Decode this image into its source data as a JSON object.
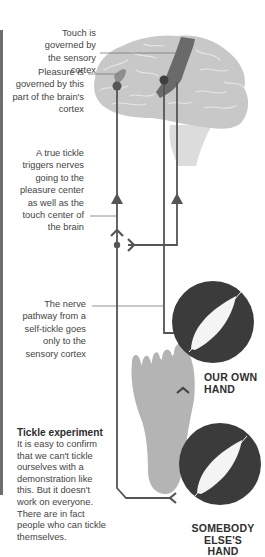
{
  "labels": {
    "touch": "Touch is governed by the sensory cortex",
    "pleasure": "Pleasure is governed by this part of the brain's cortex",
    "true_tickle": "A true tickle triggers nerves going to the pleasure center as well as the touch center of the brain",
    "nerve_pathway": "The nerve pathway from a self-tickle goes only to the sensory cortex"
  },
  "hands": {
    "own": "OUR OWN HAND",
    "else": "SOMEBODY ELSE'S HAND"
  },
  "sidebar": {
    "title": "Tickle experiment",
    "body": "It is easy to confirm that we can't tickle ourselves with a demonstration like this. But it doesn't work on everyone. There are in fact people who can tickle themselves."
  },
  "icons": {
    "brain": "brain-illustration",
    "foot": "foot-illustration",
    "feather": "feather-icon"
  },
  "colors": {
    "brain": "#c8c8c8",
    "brain_folds": "#e4e4e4",
    "cortex": "#6a6a6a",
    "line": "#555555",
    "circle": "#3b3b3b",
    "foot": "#b4b4b4",
    "left_bar": "#6e6e6e"
  }
}
